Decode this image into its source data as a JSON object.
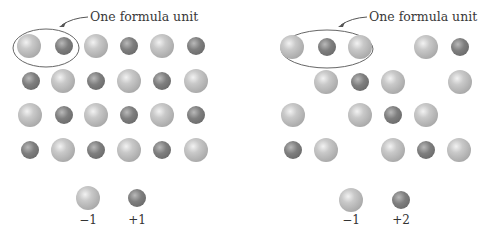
{
  "left_panel": {
    "callout_label": "One formula unit",
    "legend": [
      {
        "type": "large",
        "charge": "−1"
      },
      {
        "type": "small",
        "charge": "+1"
      }
    ],
    "rows": [
      {
        "y": 46,
        "ions": [
          {
            "x": 29,
            "t": "large"
          },
          {
            "x": 64,
            "t": "small"
          },
          {
            "x": 96,
            "t": "large"
          },
          {
            "x": 129,
            "t": "small"
          },
          {
            "x": 162,
            "t": "large"
          },
          {
            "x": 196,
            "t": "small"
          }
        ]
      },
      {
        "y": 81,
        "ions": [
          {
            "x": 31,
            "t": "small"
          },
          {
            "x": 63,
            "t": "large"
          },
          {
            "x": 96,
            "t": "small"
          },
          {
            "x": 129,
            "t": "large"
          },
          {
            "x": 162,
            "t": "small"
          },
          {
            "x": 196,
            "t": "large"
          }
        ]
      },
      {
        "y": 115,
        "ions": [
          {
            "x": 30,
            "t": "large"
          },
          {
            "x": 64,
            "t": "small"
          },
          {
            "x": 96,
            "t": "large"
          },
          {
            "x": 129,
            "t": "small"
          },
          {
            "x": 162,
            "t": "large"
          },
          {
            "x": 196,
            "t": "small"
          }
        ]
      },
      {
        "y": 150,
        "ions": [
          {
            "x": 30,
            "t": "small"
          },
          {
            "x": 63,
            "t": "large"
          },
          {
            "x": 96,
            "t": "small"
          },
          {
            "x": 129,
            "t": "large"
          },
          {
            "x": 162,
            "t": "small"
          },
          {
            "x": 196,
            "t": "large"
          }
        ]
      }
    ]
  },
  "right_panel": {
    "callout_label": "One formula unit",
    "legend": [
      {
        "type": "large",
        "charge": "−1"
      },
      {
        "type": "small",
        "charge": "+2"
      }
    ],
    "rows": [
      {
        "y": 47,
        "ions": [
          {
            "x": 292,
            "t": "large"
          },
          {
            "x": 327,
            "t": "small"
          },
          {
            "x": 360,
            "t": "large"
          },
          {
            "x": 426,
            "t": "large"
          },
          {
            "x": 460,
            "t": "small"
          }
        ]
      },
      {
        "y": 82,
        "ions": [
          {
            "x": 326,
            "t": "large"
          },
          {
            "x": 360,
            "t": "small"
          },
          {
            "x": 393,
            "t": "large"
          },
          {
            "x": 460,
            "t": "large"
          }
        ]
      },
      {
        "y": 115,
        "ions": [
          {
            "x": 293,
            "t": "large"
          },
          {
            "x": 360,
            "t": "large"
          },
          {
            "x": 393,
            "t": "small"
          },
          {
            "x": 426,
            "t": "large"
          }
        ]
      },
      {
        "y": 150,
        "ions": [
          {
            "x": 293,
            "t": "small"
          },
          {
            "x": 326,
            "t": "large"
          },
          {
            "x": 393,
            "t": "large"
          },
          {
            "x": 426,
            "t": "small"
          },
          {
            "x": 459,
            "t": "large"
          }
        ]
      }
    ]
  }
}
